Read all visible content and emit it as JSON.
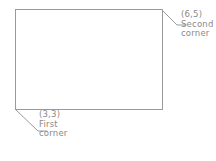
{
  "diagram": {
    "type": "rectangle-corner-annotation",
    "background_color": "#ffffff",
    "line_color": "#9a9a9a",
    "text_color": "#8a8a8a",
    "shape": {
      "name": "rectangle",
      "x": 15,
      "y": 9,
      "width": 148,
      "height": 101
    },
    "annotations": [
      {
        "id": "first-corner",
        "coordinate_label": "(3,3)",
        "name_line_1": "First",
        "name_line_2": "corner",
        "anchor": "bottom-left",
        "leader": {
          "x1": 16,
          "y1": 110,
          "x2": 38,
          "y2": 131,
          "x3": 47,
          "y3": 131
        }
      },
      {
        "id": "second-corner",
        "coordinate_label": "(6,5)",
        "name_line_1": "Second",
        "name_line_2": "corner",
        "anchor": "top-right",
        "leader": {
          "x1": 162,
          "y1": 10,
          "x2": 177,
          "y2": 25,
          "x3": 186,
          "y3": 25
        }
      }
    ]
  }
}
